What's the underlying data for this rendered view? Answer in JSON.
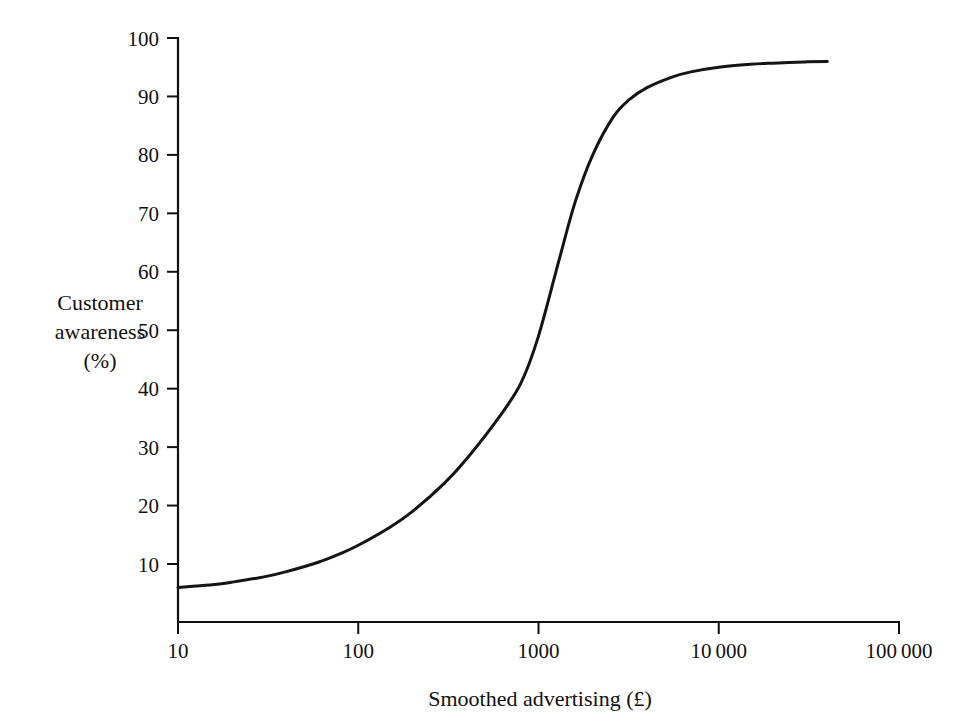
{
  "chart_data": {
    "type": "line",
    "title": "",
    "xlabel": "Smoothed advertising (£)",
    "ylabel": "Customer awareness (%)",
    "ylabel_lines": [
      "Customer",
      "awareness",
      "(%)"
    ],
    "xscale": "log",
    "yscale": "linear",
    "xlim": [
      10,
      100000
    ],
    "ylim": [
      0,
      100
    ],
    "grid": false,
    "legend": null,
    "xticks": [
      10,
      100,
      1000,
      10000,
      100000
    ],
    "xtick_labels": [
      "10",
      "100",
      "1000",
      "10000",
      "100000"
    ],
    "yticks": [
      10,
      20,
      30,
      40,
      50,
      60,
      70,
      80,
      90,
      100
    ],
    "ytick_labels": [
      "10",
      "20",
      "30",
      "40",
      "50",
      "60",
      "70",
      "80",
      "90",
      "100"
    ],
    "series": [
      {
        "name": "Customer awareness response curve",
        "x": [
          10,
          15,
          20,
          30,
          40,
          60,
          80,
          100,
          150,
          200,
          300,
          400,
          600,
          800,
          1000,
          1300,
          1600,
          2000,
          2600,
          3200,
          4000,
          5500,
          7000,
          10000,
          15000,
          20000,
          30000,
          40000
        ],
        "y": [
          6.0,
          6.4,
          6.9,
          7.8,
          8.7,
          10.3,
          11.8,
          13.2,
          16.3,
          19.0,
          23.8,
          28.0,
          35.0,
          41.0,
          49.0,
          62.0,
          72.0,
          80.0,
          86.5,
          89.5,
          91.5,
          93.3,
          94.2,
          95.0,
          95.5,
          95.7,
          95.9,
          96.0
        ]
      }
    ],
    "annotations": []
  },
  "figure": {
    "background_color": "#ffffff",
    "line_color": "#141414",
    "axis_color": "#111111"
  }
}
